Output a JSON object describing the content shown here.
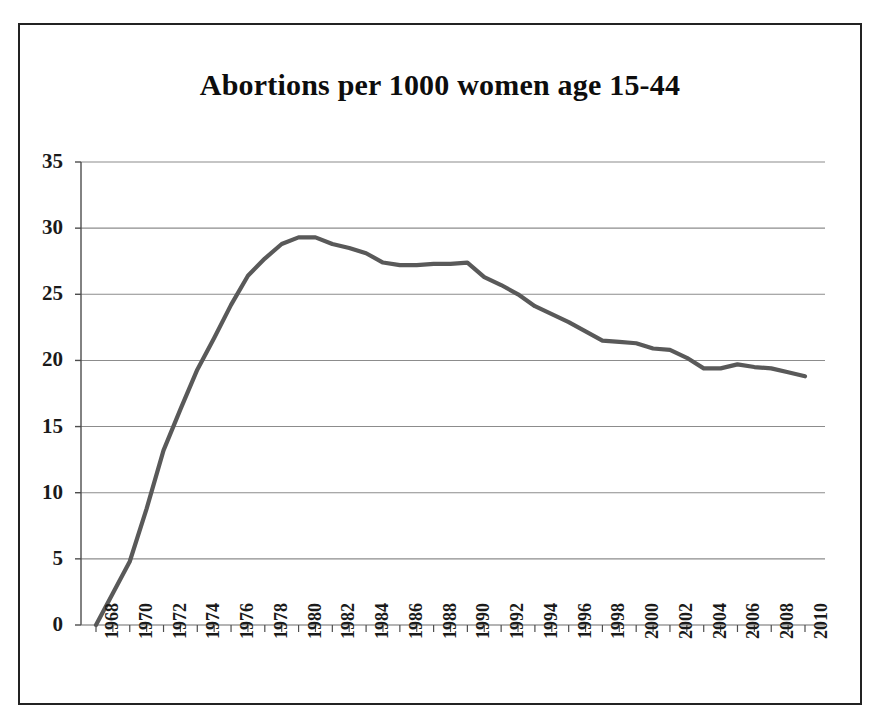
{
  "chart_data": {
    "type": "line",
    "title": "Abortions per 1000 women age 15-44",
    "xlabel": "",
    "ylabel": "",
    "ylim": [
      0,
      35
    ],
    "xlim": [
      1968,
      2010
    ],
    "ytick_step": 5,
    "xtick_step": 2,
    "grid": "horizontal",
    "legend": "none",
    "line_color": "#595959",
    "series_name": "Abortions per 1000 women age 15-44",
    "yticks": [
      "0",
      "5",
      "10",
      "15",
      "20",
      "25",
      "30",
      "35"
    ],
    "xticks": [
      "1968",
      "1970",
      "1972",
      "1974",
      "1976",
      "1978",
      "1980",
      "1982",
      "1984",
      "1986",
      "1988",
      "1990",
      "1992",
      "1994",
      "1996",
      "1998",
      "2000",
      "2002",
      "2004",
      "2006",
      "2008",
      "2010"
    ],
    "x": [
      1968,
      1969,
      1970,
      1971,
      1972,
      1973,
      1974,
      1975,
      1976,
      1977,
      1978,
      1979,
      1980,
      1981,
      1982,
      1983,
      1984,
      1985,
      1986,
      1987,
      1988,
      1989,
      1990,
      1991,
      1992,
      1993,
      1994,
      1995,
      1996,
      1997,
      1998,
      1999,
      2000,
      2001,
      2002,
      2003,
      2004,
      2005,
      2006,
      2007,
      2008,
      2009,
      2010
    ],
    "values": [
      0.0,
      2.4,
      4.8,
      8.8,
      13.2,
      16.3,
      19.3,
      21.7,
      24.2,
      26.4,
      27.7,
      28.8,
      29.3,
      29.3,
      28.8,
      28.5,
      28.1,
      27.4,
      27.2,
      27.2,
      27.3,
      27.3,
      27.4,
      26.3,
      25.7,
      25.0,
      24.1,
      23.5,
      22.9,
      22.2,
      21.5,
      21.4,
      21.3,
      20.9,
      20.8,
      20.2,
      19.4,
      19.4,
      19.7,
      19.5,
      19.4,
      19.1,
      18.8
    ]
  }
}
